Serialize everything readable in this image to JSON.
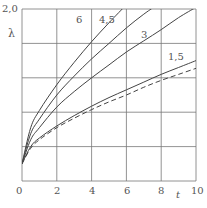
{
  "chart_data": {
    "type": "line",
    "title": "",
    "xlabel": "t",
    "ylabel": "λ",
    "xlim": [
      0,
      10
    ],
    "ylim": [
      0,
      2.0
    ],
    "grid": true,
    "x_ticks": [
      "0",
      "2",
      "4",
      "6",
      "8",
      "10"
    ],
    "y_ticks": [
      "2,0"
    ],
    "legend": "inline curve labels",
    "x": [
      0,
      0.5,
      1,
      2,
      3,
      4,
      5,
      6,
      7,
      8,
      9,
      10
    ],
    "series": [
      {
        "name": "6",
        "style": "solid",
        "values": [
          0.2,
          0.62,
          0.82,
          1.12,
          1.38,
          1.62,
          1.84,
          2.05,
          null,
          null,
          null,
          null
        ]
      },
      {
        "name": "4,5",
        "style": "solid",
        "values": [
          0.2,
          0.55,
          0.72,
          1.0,
          1.22,
          1.42,
          1.6,
          1.78,
          1.94,
          2.08,
          null,
          null
        ]
      },
      {
        "name": "3",
        "style": "solid",
        "values": [
          0.2,
          0.48,
          0.62,
          0.86,
          1.04,
          1.2,
          1.35,
          1.5,
          1.63,
          1.76,
          1.9,
          2.02
        ]
      },
      {
        "name": "1,5",
        "style": "solid",
        "values": [
          0.2,
          0.4,
          0.5,
          0.64,
          0.76,
          0.87,
          0.97,
          1.06,
          1.15,
          1.24,
          1.32,
          1.4
        ]
      },
      {
        "name": "",
        "style": "dashed",
        "values": [
          0.2,
          0.38,
          0.48,
          0.62,
          0.73,
          0.83,
          0.92,
          1.0,
          1.09,
          1.17,
          1.24,
          1.31
        ]
      }
    ],
    "annotations": [
      {
        "text": "6",
        "x": 5.3,
        "y": 1.9
      },
      {
        "text": "4,5",
        "x": 6.6,
        "y": 1.9
      },
      {
        "text": "3",
        "x": 8.0,
        "y": 1.7
      },
      {
        "text": "1,5",
        "x": 9.4,
        "y": 1.45
      }
    ]
  },
  "labels": {
    "y_top": "2,0",
    "y_axis": "λ",
    "x_axis": "t",
    "x0": "0",
    "x2": "2",
    "x4": "4",
    "x6": "6",
    "x8": "8",
    "x10": "10",
    "c6": "6",
    "c45": "4,5",
    "c3": "3",
    "c15": "1,5"
  }
}
